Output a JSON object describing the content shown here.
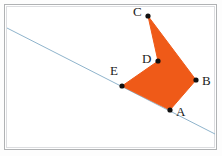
{
  "figure": {
    "type": "geometry-diagram",
    "width": 222,
    "height": 156,
    "colors": {
      "polygon_fill": "#ef5a18",
      "polygon_stroke": "#ef5a18",
      "line": "#8fb4cc",
      "point": "#111111",
      "label": "#1a1a1a",
      "frame_outer": "#b0b2b4",
      "frame_inner": "#dcdde0",
      "background": "#ffffff"
    }
  },
  "frame": {
    "outer_label": "figure-border",
    "inner_label": "figure-inner-border"
  },
  "line": {
    "name": "blue-line",
    "x1": 7,
    "y1": 28,
    "x2": 215,
    "y2": 134,
    "stroke_width": 1
  },
  "polygon": {
    "name": "orange-pentagon",
    "order": [
      "A",
      "B",
      "C",
      "D",
      "E"
    ],
    "points_attr": "170,110 196,80 148,16 158,61 122,86",
    "stroke_width": 1
  },
  "points": [
    {
      "id": "A",
      "label": "A",
      "x": 170,
      "y": 110,
      "label_x": 176,
      "label_y": 105
    },
    {
      "id": "B",
      "label": "B",
      "x": 196,
      "y": 80,
      "label_x": 202,
      "label_y": 74
    },
    {
      "id": "C",
      "label": "C",
      "x": 148,
      "y": 16,
      "label_x": 133,
      "label_y": 5
    },
    {
      "id": "D",
      "label": "D",
      "x": 158,
      "y": 61,
      "label_x": 142,
      "label_y": 52
    },
    {
      "id": "E",
      "label": "E",
      "x": 122,
      "y": 86,
      "label_x": 110,
      "label_y": 64
    }
  ]
}
